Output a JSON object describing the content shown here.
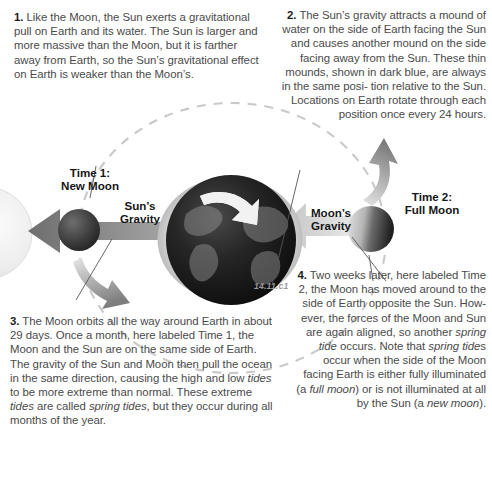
{
  "figure": {
    "label": "14.11.c1"
  },
  "colors": {
    "orbit_dash": "#c9c9c9",
    "arrow_gray": "#8f8f8f",
    "arrow_light": "#d8d8d8",
    "sun_pale": "#ededed",
    "earth_dark": "#1a1a1a",
    "bulge_ring": "#c6c6c6",
    "text": "#4a4a4a",
    "heading": "#161616",
    "leader_line": "#555555"
  },
  "texts": {
    "block1": {
      "number": "1.",
      "lines": [
        "Like the Moon, the Sun exerts a",
        "gravitational pull on Earth and its water.",
        "The Sun is larger and more massive",
        "than the Moon, but it is farther away",
        "from Earth, so the Sun’s",
        "gravitational effect on",
        "Earth is weaker than",
        "the Moon’s."
      ]
    },
    "block2": {
      "number": "2.",
      "lines": [
        "The Sun’s gravity attracts a mound of",
        "water on the side of Earth facing the",
        "Sun and causes another mound on the",
        "side facing away from the Sun. These",
        "thin mounds, shown in dark blue,",
        "are always in the same posi-",
        "tion relative to the Sun.",
        "Locations on Earth",
        "rotate through each",
        "position once every",
        "24 hours."
      ]
    },
    "block3": {
      "number": "3.",
      "lines": [
        "The",
        "Moon",
        "orbits all the",
        "way around Earth in",
        "about 29 days. Once a",
        "month, here labeled Time 1,",
        "the Moon and the Sun are on the",
        "same side of Earth. The gravity of the Sun and",
        "Moon then pull the ocean in the same direction,",
        "causing the high and low tides to be more",
        "extreme than normal. These extreme tides are",
        "called spring tides, but they occur during all",
        "months of the year."
      ],
      "italic_phrases": [
        "spring tides"
      ]
    },
    "block4": {
      "number": "4.",
      "lines": [
        "Two weeks",
        "later, here",
        "labeled Time 2,",
        "the Moon has",
        "moved around to",
        "the side of Earth",
        "opposite the Sun. How-",
        "ever, the forces of the Moon",
        "and Sun are again aligned, so",
        "another spring tide occurs. Note",
        "that spring tides occur when the",
        "side of the Moon facing Earth is",
        "either fully illuminated (a full",
        "moon) or is not illuminated at all",
        "by the Sun (a new moon)."
      ],
      "italic_phrases": [
        "spring tide",
        "full moon",
        "new moon"
      ]
    }
  },
  "labels": {
    "time1": "Time 1:\nNew Moon",
    "time2": "Time 2:\nFull Moon",
    "suns_gravity": "Sun’s\nGravity",
    "moons_gravity": "Moon’s\nGravity"
  },
  "diagram": {
    "sun": {
      "name": "sun",
      "cx": -14,
      "cy": 233,
      "r": 46,
      "note": "pale sphere cropped at left edge"
    },
    "earth": {
      "name": "earth",
      "cx": 230,
      "cy": 239,
      "r": 71,
      "rotation_arrows": 2
    },
    "moon_new": {
      "name": "moon-new-moon",
      "cx": 79,
      "cy": 230,
      "r": 21,
      "phase": "new"
    },
    "moon_full": {
      "name": "moon-full-moon",
      "cx": 371,
      "cy": 229,
      "r": 23,
      "phase": "full"
    },
    "orbit": {
      "type": "dashed-ellipse",
      "cx": 232,
      "cy": 238,
      "rx": 154,
      "ry": 135
    },
    "arrows": [
      {
        "name": "suns-gravity-arrow",
        "direction": "left",
        "tone": "dark-gray"
      },
      {
        "name": "moons-gravity-arrow",
        "direction": "left",
        "tone": "light-gray"
      },
      {
        "name": "orbit-arrow-upper-right",
        "direction": "counterclockwise",
        "tone": "gray"
      },
      {
        "name": "orbit-arrow-lower-left",
        "direction": "counterclockwise",
        "tone": "gray"
      }
    ]
  }
}
